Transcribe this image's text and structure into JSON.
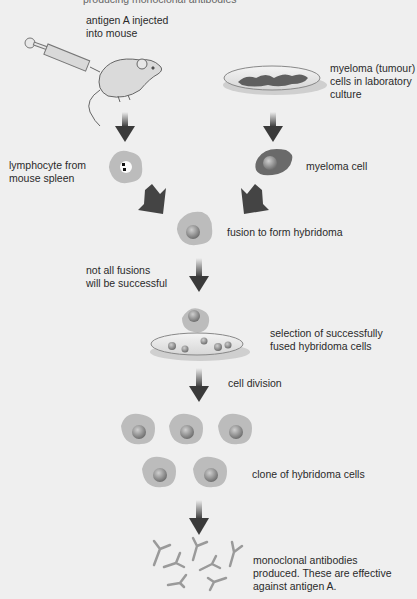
{
  "title_cropped": "producing monoclonal antibodies",
  "labels": {
    "antigen_injected": "antigen A injected\ninto mouse",
    "myeloma_culture": "myeloma (tumour)\ncells in laboratory\nculture",
    "lymphocyte": "lymphocyte from\nmouse spleen",
    "myeloma_cell": "myeloma cell",
    "fusion": "fusion to form hybridoma",
    "not_all": "not all fusions\nwill be successful",
    "selection": "selection of successfully\nfused hybridoma cells",
    "cell_division": "cell division",
    "clone": "clone of hybridoma cells",
    "antibodies": "monoclonal antibodies\nproduced. These are effective\nagainst antigen A."
  },
  "colors": {
    "background": "#efefef",
    "arrow": "#3a3a3a",
    "cell": "#bdbdbd",
    "nucleus": "#8a8a8a",
    "myeloma": "#6e6e6e",
    "antibody": "#9a9a9a"
  }
}
